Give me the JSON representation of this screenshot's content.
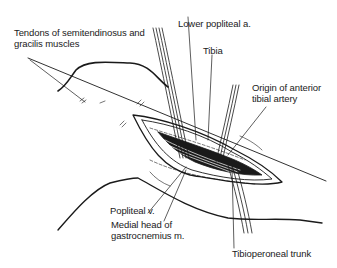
{
  "diagram": {
    "type": "surgical-anatomy-illustration",
    "labels": {
      "tendons": [
        "Tendons of semitendinosus and",
        "gracilis muscles"
      ],
      "lower_popliteal": "Lower popliteal a.",
      "tibia": "Tibia",
      "origin_anterior": [
        "Origin of anterior",
        "tibial artery"
      ],
      "popliteal_v": "Popliteal v.",
      "medial_head": [
        "Medial head of",
        "gastrocnemius m."
      ],
      "tibioperoneal": "Tibioperoneal trunk"
    },
    "colors": {
      "line": "#1a1a1a",
      "background": "#ffffff"
    }
  }
}
